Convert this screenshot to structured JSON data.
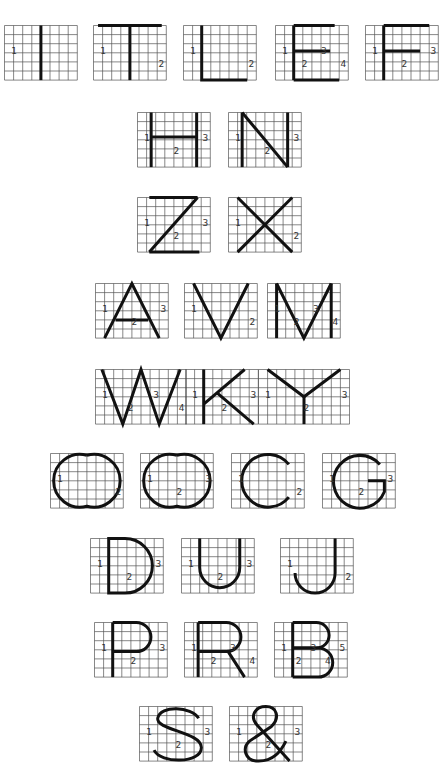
{
  "colors": {
    "grid": "#555555",
    "stroke": "#111111",
    "guide": "#7a7a7a",
    "background": "#ffffff"
  },
  "letters": [
    {
      "char": "I",
      "row": 1,
      "x": 4,
      "y": 25,
      "cols": 8,
      "rows": 6,
      "labels": [
        "1"
      ]
    },
    {
      "char": "T",
      "row": 1,
      "x": 93,
      "y": 25,
      "cols": 8,
      "rows": 6,
      "labels": [
        "1",
        "2"
      ]
    },
    {
      "char": "L",
      "row": 1,
      "x": 183,
      "y": 25,
      "cols": 8,
      "rows": 6,
      "labels": [
        "1",
        "2"
      ]
    },
    {
      "char": "E",
      "row": 1,
      "x": 275,
      "y": 25,
      "cols": 8,
      "rows": 6,
      "labels": [
        "1",
        "2",
        "3",
        "4"
      ]
    },
    {
      "char": "F",
      "row": 1,
      "x": 365,
      "y": 25,
      "cols": 8,
      "rows": 6,
      "labels": [
        "1",
        "2",
        "3"
      ]
    },
    {
      "char": "H",
      "row": 2,
      "x": 137,
      "y": 112,
      "cols": 8,
      "rows": 6,
      "labels": [
        "1",
        "2",
        "3"
      ]
    },
    {
      "char": "N",
      "row": 2,
      "x": 228,
      "y": 112,
      "cols": 8,
      "rows": 6,
      "labels": [
        "1",
        "2",
        "3"
      ]
    },
    {
      "char": "Z",
      "row": 3,
      "x": 137,
      "y": 197,
      "cols": 8,
      "rows": 6,
      "labels": [
        "1",
        "2",
        "3"
      ]
    },
    {
      "char": "X",
      "row": 3,
      "x": 228,
      "y": 197,
      "cols": 8,
      "rows": 6,
      "labels": [
        "1",
        "2"
      ]
    },
    {
      "char": "A",
      "row": 4,
      "x": 95,
      "y": 283,
      "cols": 8,
      "rows": 6,
      "labels": [
        "1",
        "2",
        "3"
      ]
    },
    {
      "char": "V",
      "row": 4,
      "x": 184,
      "y": 283,
      "cols": 8,
      "rows": 6,
      "labels": [
        "1",
        "2"
      ]
    },
    {
      "char": "M",
      "row": 4,
      "x": 267,
      "y": 283,
      "cols": 8,
      "rows": 6,
      "labels": [
        "1",
        "2",
        "3",
        "4"
      ]
    },
    {
      "char": "W",
      "row": 5,
      "x": 95,
      "y": 369,
      "cols": 10,
      "rows": 6,
      "labels": [
        "1",
        "2",
        "3",
        "4"
      ]
    },
    {
      "char": "K",
      "row": 5,
      "x": 185,
      "y": 369,
      "cols": 8,
      "rows": 6,
      "labels": [
        "1",
        "2",
        "3"
      ]
    },
    {
      "char": "Y",
      "row": 5,
      "x": 258,
      "y": 369,
      "cols": 10,
      "rows": 6,
      "labels": [
        "1",
        "2",
        "3"
      ]
    },
    {
      "char": "O",
      "row": 6,
      "x": 50,
      "y": 453,
      "cols": 8,
      "rows": 6,
      "labels": [
        "1",
        "2"
      ]
    },
    {
      "char": "Q",
      "row": 6,
      "x": 140,
      "y": 453,
      "cols": 8,
      "rows": 6,
      "labels": [
        "1",
        "2",
        "3"
      ]
    },
    {
      "char": "C",
      "row": 6,
      "x": 231,
      "y": 453,
      "cols": 8,
      "rows": 6,
      "labels": [
        "1",
        "2"
      ]
    },
    {
      "char": "G",
      "row": 6,
      "x": 322,
      "y": 453,
      "cols": 8,
      "rows": 6,
      "labels": [
        "1",
        "2",
        "3"
      ]
    },
    {
      "char": "D",
      "row": 7,
      "x": 90,
      "y": 538,
      "cols": 8,
      "rows": 6,
      "labels": [
        "1",
        "2",
        "3"
      ]
    },
    {
      "char": "U",
      "row": 7,
      "x": 181,
      "y": 538,
      "cols": 8,
      "rows": 6,
      "labels": [
        "1",
        "2",
        "3"
      ]
    },
    {
      "char": "J",
      "row": 7,
      "x": 280,
      "y": 538,
      "cols": 8,
      "rows": 6,
      "labels": [
        "1",
        "2"
      ]
    },
    {
      "char": "P",
      "row": 8,
      "x": 94,
      "y": 622,
      "cols": 8,
      "rows": 6,
      "labels": [
        "1",
        "2",
        "3"
      ]
    },
    {
      "char": "R",
      "row": 8,
      "x": 184,
      "y": 622,
      "cols": 8,
      "rows": 6,
      "labels": [
        "1",
        "2",
        "3",
        "4"
      ]
    },
    {
      "char": "B",
      "row": 8,
      "x": 274,
      "y": 622,
      "cols": 8,
      "rows": 6,
      "labels": [
        "1",
        "2",
        "3",
        "4",
        "5"
      ]
    },
    {
      "char": "S",
      "row": 9,
      "x": 139,
      "y": 706,
      "cols": 8,
      "rows": 6,
      "labels": [
        "1",
        "2",
        "3"
      ]
    },
    {
      "char": "&",
      "row": 9,
      "x": 229,
      "y": 706,
      "cols": 8,
      "rows": 6,
      "labels": [
        "1",
        "2",
        "3"
      ]
    }
  ]
}
